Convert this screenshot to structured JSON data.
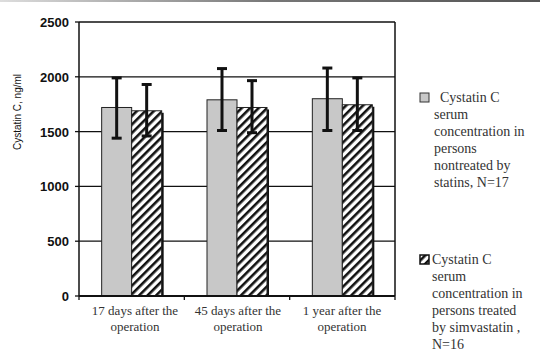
{
  "chart_data": {
    "type": "bar",
    "title": "",
    "xlabel": "",
    "ylabel": "Cystatin C, ng/ml",
    "ylim": [
      0,
      2500
    ],
    "yticks": [
      0,
      500,
      1000,
      1500,
      2000,
      2500
    ],
    "grid": true,
    "legend_position": "right",
    "categories": [
      "17 days after the operation",
      "45 days after the operation",
      "1 year after the operation"
    ],
    "series": [
      {
        "name": "Cystatin C serum concentration in persons nontreated by statins, N=17",
        "fill": "#c8c8c8",
        "values": [
          1720,
          1790,
          1800
        ],
        "error_low": [
          1440,
          1510,
          1510
        ],
        "error_high": [
          1990,
          2075,
          2080
        ]
      },
      {
        "name": "Cystatin C serum concentration in persons treated by simvastatin , N=16",
        "fill": "hatched",
        "values": [
          1690,
          1720,
          1745
        ],
        "error_low": [
          1460,
          1490,
          1510
        ],
        "error_high": [
          1930,
          1965,
          1990
        ]
      }
    ]
  },
  "labels": {
    "ylabel": "Cystatin C, ng/ml",
    "cat0a": "17 days after the",
    "cat0b": "operation",
    "cat1a": "45 days after the",
    "cat1b": "operation",
    "cat2a": "1 year after the",
    "cat2b": "operation",
    "legend0": [
      "Cystatin C",
      "serum",
      "concentration in",
      "persons",
      "nontreated by",
      "statins, N=17"
    ],
    "legend1": [
      "Cystatin C",
      "serum",
      "concentration in",
      "persons treated",
      "by simvastatin ,",
      "N=16"
    ]
  }
}
